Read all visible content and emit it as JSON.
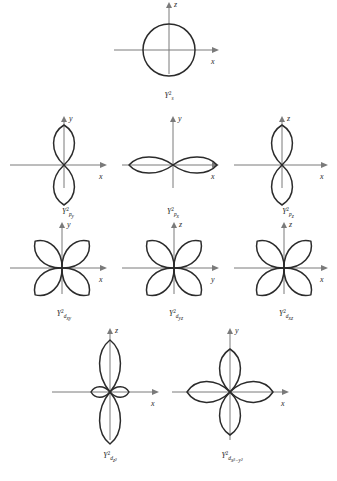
{
  "figure": {
    "type": "orbital-angular-distribution-plate",
    "background_color": "#ffffff",
    "curve_color": "#2b2b2b",
    "axis_color": "#7a7a7a",
    "width": 337,
    "height": 481
  },
  "panels": [
    {
      "id": "s",
      "shape": "circle",
      "caption_symbol": "Y",
      "caption_superscript": "2",
      "caption_subscript": "s",
      "caption_subscript_sup": "",
      "axes": {
        "vertical": "z",
        "horizontal": "x"
      },
      "x": 110,
      "y": 4,
      "w": 118,
      "h": 100,
      "cx": 59,
      "cy": 46,
      "radius": 26,
      "lobe_count": 0,
      "lobe_angles": [],
      "lobe_length": 0,
      "lobe_width": 0,
      "extra_lobes": [],
      "caption_x": 59,
      "caption_y": 88
    },
    {
      "id": "p_y",
      "shape": "two-lobe",
      "caption_symbol": "Y",
      "caption_superscript": "2",
      "caption_subscript": "p",
      "caption_subscript_sup": "y",
      "axes": {
        "vertical": "y",
        "horizontal": "x"
      },
      "x": 6,
      "y": 118,
      "w": 110,
      "h": 100,
      "cx": 58,
      "cy": 47,
      "radius": 0,
      "lobe_count": 2,
      "lobe_angles": [
        90,
        270
      ],
      "lobe_length": 40,
      "lobe_width": 26,
      "extra_lobes": [],
      "caption_x": 62,
      "caption_y": 90
    },
    {
      "id": "p_x",
      "shape": "two-lobe",
      "caption_symbol": "Y",
      "caption_superscript": "2",
      "caption_subscript": "p",
      "caption_subscript_sup": "x",
      "axes": {
        "vertical": "y",
        "horizontal": "x"
      },
      "x": 118,
      "y": 118,
      "w": 110,
      "h": 100,
      "cx": 55,
      "cy": 47,
      "radius": 0,
      "lobe_count": 2,
      "lobe_angles": [
        0,
        180
      ],
      "lobe_length": 44,
      "lobe_width": 20,
      "extra_lobes": [],
      "caption_x": 55,
      "caption_y": 90
    },
    {
      "id": "p_z",
      "shape": "two-lobe",
      "caption_symbol": "Y",
      "caption_superscript": "2",
      "caption_subscript": "p",
      "caption_subscript_sup": "z",
      "axes": {
        "vertical": "z",
        "horizontal": "x"
      },
      "x": 230,
      "y": 118,
      "w": 107,
      "h": 100,
      "cx": 52,
      "cy": 47,
      "radius": 0,
      "lobe_count": 2,
      "lobe_angles": [
        90,
        270
      ],
      "lobe_length": 40,
      "lobe_width": 26,
      "extra_lobes": [],
      "caption_x": 58,
      "caption_y": 90
    },
    {
      "id": "d_xy",
      "shape": "four-lobe",
      "caption_symbol": "Y",
      "caption_superscript": "2",
      "caption_subscript": "d",
      "caption_subscript_sup": "xy",
      "axes": {
        "vertical": "y",
        "horizontal": "x"
      },
      "x": 6,
      "y": 224,
      "w": 110,
      "h": 100,
      "cx": 56,
      "cy": 44,
      "radius": 0,
      "lobe_count": 4,
      "lobe_angles": [
        45,
        135,
        225,
        315
      ],
      "lobe_length": 38,
      "lobe_width": 24,
      "extra_lobes": [],
      "caption_x": 58,
      "caption_y": 86
    },
    {
      "id": "d_yz",
      "shape": "four-lobe",
      "caption_symbol": "Y",
      "caption_superscript": "2",
      "caption_subscript": "d",
      "caption_subscript_sup": "yz",
      "axes": {
        "vertical": "z",
        "horizontal": "y"
      },
      "x": 118,
      "y": 224,
      "w": 110,
      "h": 100,
      "cx": 56,
      "cy": 44,
      "radius": 0,
      "lobe_count": 4,
      "lobe_angles": [
        45,
        135,
        225,
        315
      ],
      "lobe_length": 38,
      "lobe_width": 24,
      "extra_lobes": [],
      "caption_x": 58,
      "caption_y": 86
    },
    {
      "id": "d_xz",
      "shape": "four-lobe",
      "caption_symbol": "Y",
      "caption_superscript": "2",
      "caption_subscript": "d",
      "caption_subscript_sup": "xz",
      "axes": {
        "vertical": "z",
        "horizontal": "x"
      },
      "x": 230,
      "y": 224,
      "w": 107,
      "h": 100,
      "cx": 54,
      "cy": 44,
      "radius": 0,
      "lobe_count": 4,
      "lobe_angles": [
        45,
        135,
        225,
        315
      ],
      "lobe_length": 38,
      "lobe_width": 24,
      "extra_lobes": [],
      "caption_x": 56,
      "caption_y": 86
    },
    {
      "id": "d_z2",
      "shape": "dz2",
      "caption_symbol": "Y",
      "caption_superscript": "2",
      "caption_subscript": "d",
      "caption_subscript_sup": "z2",
      "axes": {
        "vertical": "z",
        "horizontal": "x"
      },
      "x": 48,
      "y": 330,
      "w": 120,
      "h": 140,
      "cx": 62,
      "cy": 62,
      "radius": 0,
      "lobe_count": 2,
      "lobe_angles": [
        90,
        270
      ],
      "lobe_length": 52,
      "lobe_width": 26,
      "extra_lobes": [
        {
          "angle": 0,
          "length": 19,
          "width": 13
        },
        {
          "angle": 180,
          "length": 19,
          "width": 13
        }
      ],
      "caption_x": 62,
      "caption_y": 122
    },
    {
      "id": "d_x2y2",
      "shape": "four-lobe",
      "caption_symbol": "Y",
      "caption_superscript": "2",
      "caption_subscript": "d",
      "caption_subscript_sup": "x2-y2",
      "axes": {
        "vertical": "y",
        "horizontal": "x"
      },
      "x": 168,
      "y": 330,
      "w": 130,
      "h": 140,
      "cx": 62,
      "cy": 62,
      "radius": 0,
      "lobe_count": 4,
      "lobe_angles": [
        0,
        90,
        180,
        270
      ],
      "lobe_length": 43,
      "lobe_width": 26,
      "extra_lobes": [],
      "caption_x": 64,
      "caption_y": 122
    }
  ],
  "caption_parts": {
    "s": {
      "sym": "Y",
      "sup": "2",
      "sub": "s",
      "subsup": ""
    },
    "p_y": {
      "sym": "Y",
      "sup": "2",
      "sub": "p",
      "subsup": "y"
    },
    "p_x": {
      "sym": "Y",
      "sup": "2",
      "sub": "p",
      "subsup": "x"
    },
    "p_z": {
      "sym": "Y",
      "sup": "2",
      "sub": "p",
      "subsup": "z"
    },
    "d_xy": {
      "sym": "Y",
      "sup": "2",
      "sub": "d",
      "subsup": "xy"
    },
    "d_yz": {
      "sym": "Y",
      "sup": "2",
      "sub": "d",
      "subsup": "yz"
    },
    "d_xz": {
      "sym": "Y",
      "sup": "2",
      "sub": "d",
      "subsup": "xz"
    },
    "d_z2": {
      "sym": "Y",
      "sup": "2",
      "sub": "d",
      "subsup": "z²"
    },
    "d_x2y2": {
      "sym": "Y",
      "sup": "2",
      "sub": "d",
      "subsup": "x²−y²"
    }
  }
}
